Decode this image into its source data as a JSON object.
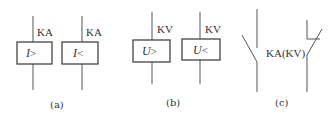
{
  "panels": [
    {
      "id": "a",
      "caption": "(a)",
      "relays": [
        {
          "tag": "KA",
          "symbol": "I>",
          "var": "I",
          "op": ">"
        },
        {
          "tag": "KA",
          "symbol": "I<",
          "var": "I",
          "op": "<"
        }
      ]
    },
    {
      "id": "b",
      "caption": "(b)",
      "relays": [
        {
          "tag": "KV",
          "symbol": "U>",
          "var": "U",
          "op": ">"
        },
        {
          "tag": "KV",
          "symbol": "U<",
          "var": "U",
          "op": "<"
        }
      ]
    },
    {
      "id": "c",
      "caption": "(c)",
      "contact_label": "KA(KV)",
      "contacts": [
        "normally-open",
        "normally-closed"
      ]
    }
  ],
  "colors": {
    "line": "#555555",
    "text": "#333333",
    "background": "#ffffff"
  }
}
